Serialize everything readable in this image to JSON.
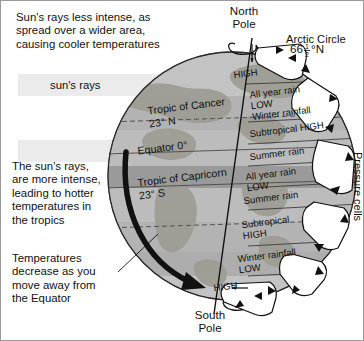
{
  "diagram": {
    "type": "earth-climate-zones"
  },
  "annotations": {
    "top_note": "Sun's rays less intense, as\nspread over a wider area,\ncausing cooler temperatures",
    "sun_rays_label": "sun's rays",
    "mid_note": "The sun's rays,\nare more intense,\nleading to hotter\ntemperatures in\nthe tropics",
    "bottom_note": "Temperatures\ndecrease as you\nmove away from\nthe Equator"
  },
  "poles": {
    "north_line1": "North",
    "north_line2": "Pole",
    "south_line1": "South",
    "south_line2": "Pole"
  },
  "arctic_circle": {
    "name": "Arctic Circle",
    "latitude_value": "66",
    "latitude_fraction_num": "1",
    "latitude_fraction_den": "2",
    "latitude_suffix": "°N"
  },
  "latitude_lines": [
    {
      "name": "Tropic of Cancer",
      "value": "23° N"
    },
    {
      "name": "Equator 0°",
      "value": ""
    },
    {
      "name": "Tropic of Capricorn",
      "value": "23° S"
    }
  ],
  "pressure_cells_label": "Pressure cells",
  "climate_bands": [
    {
      "id": "north-pole-high",
      "labels": [
        "HIGH"
      ]
    },
    {
      "id": "north-temperate",
      "labels": [
        "All year rain",
        "LOW",
        "Winter rainfall"
      ]
    },
    {
      "id": "north-subtropical",
      "labels": [
        "Subtropical HIGH"
      ]
    },
    {
      "id": "north-summer",
      "labels": [
        "Summer rain"
      ]
    },
    {
      "id": "equatorial",
      "labels": [
        "All year rain",
        "LOW"
      ]
    },
    {
      "id": "south-summer",
      "labels": [
        "Summer rain"
      ]
    },
    {
      "id": "south-subtropical",
      "labels": [
        "Subtropical",
        "HIGH"
      ]
    },
    {
      "id": "south-temperate",
      "labels": [
        "Winter rainfall",
        "LOW"
      ]
    },
    {
      "id": "south-pole-high",
      "labels": [
        "HIGH"
      ]
    }
  ],
  "colors": {
    "ocean": "#b9b9b9",
    "land": "#a0a099",
    "equator_band": "#9a9a9a",
    "shaded_band": "#adadad",
    "ray_band": "#ebebeb",
    "outline": "#111111",
    "frame": "#9a9a9a"
  }
}
